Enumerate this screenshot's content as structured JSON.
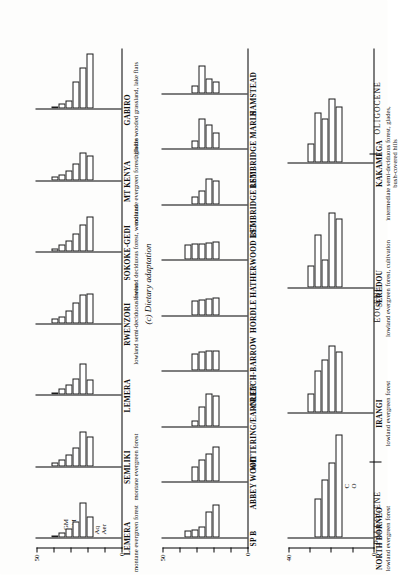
{
  "figure": {
    "caption": "(c) Dietary adaptation",
    "axis": {
      "row1_max_label": "50",
      "row2_max_label": "50",
      "row3_max_label": "40",
      "zero_label": "0"
    },
    "legends": {
      "diet": [
        "LGM",
        "SGM",
        "Arb",
        "Som",
        "Aq",
        "Aer"
      ],
      "locomotion": [
        "F",
        "HB",
        "HG",
        "C",
        "O"
      ]
    },
    "epochs": [
      {
        "name": "OLIGOCENE"
      },
      {
        "name": "EOCENE"
      },
      {
        "name": "PALEOCENE"
      }
    ]
  },
  "chart_data": {
    "type": "bar",
    "title": "(c) Dietary adaptation",
    "xlabel": "",
    "ylabel": "percentage of species",
    "grid": false,
    "legend_position": "inline-left",
    "panels": [
      {
        "row": 1,
        "site": "LEMERA",
        "habitat": "montane evergreen forest",
        "categories": [
          "LGM",
          "SGM",
          "Arb",
          "Som",
          "Aq",
          "Aer"
        ],
        "values": [
          18,
          30,
          14,
          8,
          4,
          2
        ],
        "ylim": [
          0,
          50
        ]
      },
      {
        "row": 1,
        "site": "SEMLIKI",
        "habitat": "montane evergreen forest",
        "categories": [
          "LGM",
          "SGM",
          "Arb",
          "Som",
          "Aq",
          "Aer"
        ],
        "values": [
          26,
          30,
          16,
          10,
          6,
          3
        ],
        "ylim": [
          0,
          50
        ]
      },
      {
        "row": 1,
        "site": "LEMERA",
        "habitat": "",
        "categories": [
          "LGM",
          "SGM",
          "Arb",
          "Som",
          "Aq",
          "Aer"
        ],
        "values": [
          13,
          27,
          14,
          9,
          5,
          2
        ],
        "ylim": [
          0,
          50
        ]
      },
      {
        "row": 1,
        "site": "RWENZORI",
        "habitat": "lowland semi-deciduous forest",
        "categories": [
          "LGM",
          "SGM",
          "Arb",
          "Som",
          "Aq",
          "Aer"
        ],
        "values": [
          26,
          25,
          18,
          11,
          6,
          4
        ],
        "ylim": [
          0,
          50
        ]
      },
      {
        "row": 1,
        "site": "SOKOKE-GEDI",
        "habitat": "lowland deciduous forest, woodland",
        "categories": [
          "LGM",
          "SGM",
          "Arb",
          "Som",
          "Aq",
          "Aer"
        ],
        "values": [
          31,
          24,
          16,
          10,
          6,
          3
        ],
        "ylim": [
          0,
          50
        ]
      },
      {
        "row": 1,
        "site": "MT KENYA",
        "habitat": "montane evergreen forest, glades",
        "categories": [
          "LGM",
          "SGM",
          "Arb",
          "Som",
          "Aq",
          "Aer"
        ],
        "values": [
          22,
          24,
          15,
          9,
          5,
          3
        ],
        "ylim": [
          0,
          50
        ]
      },
      {
        "row": 1,
        "site": "GABIRO",
        "habitat": "hillside wooded grassland, lake flats",
        "categories": [
          "LGM",
          "SGM",
          "Arb",
          "Som",
          "Aq",
          "Aer"
        ],
        "values": [
          48,
          36,
          24,
          7,
          5,
          2
        ],
        "ylim": [
          0,
          50
        ]
      },
      {
        "row": 2,
        "site": "SP B",
        "habitat": "",
        "categories": [
          "LGM",
          "SGM",
          "Arb",
          "Som",
          "Aq",
          "Aer"
        ],
        "values": [
          40,
          31,
          13,
          9,
          8,
          0
        ],
        "ylim": [
          0,
          50
        ]
      },
      {
        "row": 2,
        "site": "ABBEY WOOD",
        "habitat": "",
        "categories": [
          "LGM",
          "SGM",
          "Arb",
          "Som",
          "Aq",
          "Aer"
        ],
        "values": [
          43,
          34,
          27,
          19,
          0,
          0
        ],
        "ylim": [
          0,
          50
        ]
      },
      {
        "row": 2,
        "site": "WITTERING/EARNLEY",
        "habitat": "",
        "categories": [
          "LGM",
          "SGM",
          "Arb",
          "Som",
          "Aq",
          "Aer"
        ],
        "values": [
          37,
          40,
          24,
          7,
          0,
          0
        ],
        "ylim": [
          0,
          50
        ]
      },
      {
        "row": 2,
        "site": "CREECH-BARROW",
        "habitat": "",
        "categories": [
          "LGM",
          "SGM",
          "Arb",
          "Som",
          "Aq",
          "Aer"
        ],
        "values": [
          25,
          24,
          23,
          21,
          0,
          0
        ],
        "ylim": [
          0,
          50
        ]
      },
      {
        "row": 2,
        "site": "HORDLE",
        "habitat": "",
        "categories": [
          "LGM",
          "SGM",
          "Arb",
          "Som",
          "Aq",
          "Aer"
        ],
        "values": [
          21,
          20,
          19,
          18,
          0,
          0
        ],
        "ylim": [
          0,
          50
        ]
      },
      {
        "row": 2,
        "site": "HATHERWOOD LST",
        "habitat": "",
        "categories": [
          "LGM",
          "SGM",
          "Arb",
          "Som",
          "Aq",
          "Aer"
        ],
        "values": [
          22,
          21,
          20,
          19,
          18,
          0
        ],
        "ylim": [
          0,
          50
        ]
      },
      {
        "row": 2,
        "site": "BEMBRIDGE LST",
        "habitat": "",
        "categories": [
          "LGM",
          "SGM",
          "Arb",
          "Som",
          "Aq",
          "Aer"
        ],
        "values": [
          29,
          31,
          16,
          9,
          0,
          0
        ],
        "ylim": [
          0,
          50
        ]
      },
      {
        "row": 2,
        "site": "BEMBRIDGE MARLS",
        "habitat": "",
        "categories": [
          "LGM",
          "SGM",
          "Arb",
          "Som",
          "Aq",
          "Aer"
        ],
        "values": [
          20,
          29,
          36,
          10,
          0,
          0
        ],
        "ylim": [
          0,
          50
        ]
      },
      {
        "row": 2,
        "site": "HAMSTEAD",
        "habitat": "",
        "categories": [
          "LGM",
          "SGM",
          "Arb",
          "Som",
          "Aq",
          "Aer"
        ],
        "values": [
          14,
          17,
          33,
          9,
          0,
          0
        ],
        "ylim": [
          0,
          50
        ]
      },
      {
        "row": 3,
        "site": "NORTH BORNEO",
        "habitat": "lowland evergreen forest",
        "categories": [
          "F",
          "HB",
          "HG",
          "C",
          "O"
        ],
        "values": [
          37,
          27,
          21,
          14,
          0
        ],
        "ylim": [
          0,
          40
        ]
      },
      {
        "row": 3,
        "site": "IRANGI",
        "habitat": "lowland evergreen forest",
        "categories": [
          "F",
          "HB",
          "HG",
          "C",
          "O"
        ],
        "values": [
          22,
          24,
          19,
          15,
          7
        ],
        "ylim": [
          0,
          40
        ]
      },
      {
        "row": 3,
        "site": "SEREDOU",
        "habitat": "lowland evergreen forest, cultivation",
        "categories": [
          "F",
          "HB",
          "HG",
          "C",
          "O"
        ],
        "values": [
          25,
          27,
          10,
          19,
          8
        ],
        "ylim": [
          0,
          40
        ]
      },
      {
        "row": 3,
        "site": "KAKAMEGA",
        "habitat": "intermediate semi-deciduous forest, glades, bush-covered hills",
        "categories": [
          "F",
          "HB",
          "HG",
          "C",
          "O"
        ],
        "values": [
          20,
          23,
          16,
          18,
          7
        ],
        "ylim": [
          0,
          40
        ]
      }
    ]
  }
}
